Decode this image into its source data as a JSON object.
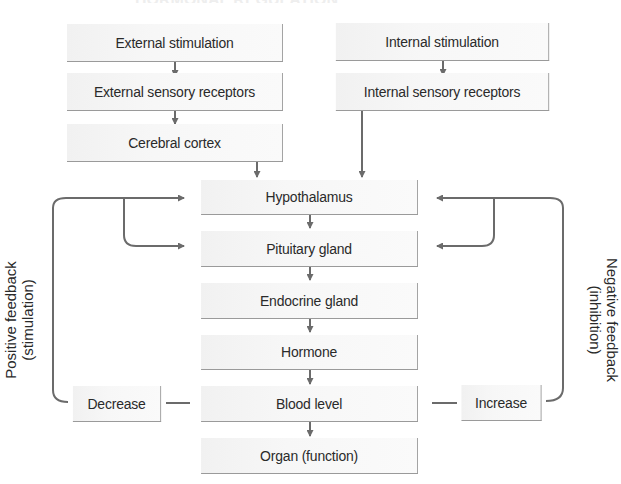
{
  "diagram": {
    "title_fragment": "HORMONAL REGULATION",
    "boxes": {
      "external_stimulation": "External stimulation",
      "external_sensory_receptors": "External sensory receptors",
      "cerebral_cortex": "Cerebral cortex",
      "internal_stimulation": "Internal stimulation",
      "internal_sensory_receptors": "Internal sensory receptors",
      "hypothalamus": "Hypothalamus",
      "pituitary_gland": "Pituitary gland",
      "endocrine_gland": "Endocrine gland",
      "hormone": "Hormone",
      "blood_level": "Blood level",
      "organ_function": "Organ (function)",
      "decrease": "Decrease",
      "increase": "Increase"
    },
    "side_labels": {
      "positive_line1": "Positive feedback",
      "positive_line2": "(stimulation)",
      "negative_line1": "Negative feedback",
      "negative_line2": "(inhibition)"
    },
    "edges": [
      [
        "External stimulation",
        "External sensory receptors"
      ],
      [
        "External sensory receptors",
        "Cerebral cortex"
      ],
      [
        "Cerebral cortex",
        "Hypothalamus"
      ],
      [
        "Internal stimulation",
        "Internal sensory receptors"
      ],
      [
        "Internal sensory receptors",
        "Hypothalamus"
      ],
      [
        "Hypothalamus",
        "Pituitary gland"
      ],
      [
        "Pituitary gland",
        "Endocrine gland"
      ],
      [
        "Endocrine gland",
        "Hormone"
      ],
      [
        "Hormone",
        "Blood level"
      ],
      [
        "Blood level",
        "Organ (function)"
      ],
      [
        "Blood level",
        "Decrease"
      ],
      [
        "Decrease",
        "Hypothalamus",
        "positive feedback"
      ],
      [
        "Decrease",
        "Pituitary gland",
        "positive feedback"
      ],
      [
        "Blood level",
        "Increase"
      ],
      [
        "Increase",
        "Hypothalamus",
        "negative feedback"
      ],
      [
        "Increase",
        "Pituitary gland",
        "negative feedback"
      ]
    ],
    "colors": {
      "box_fill": "#f5f5f5",
      "box_border": "#9a9a9a",
      "line": "#6b6b6b",
      "text": "#2a2a2a"
    }
  }
}
